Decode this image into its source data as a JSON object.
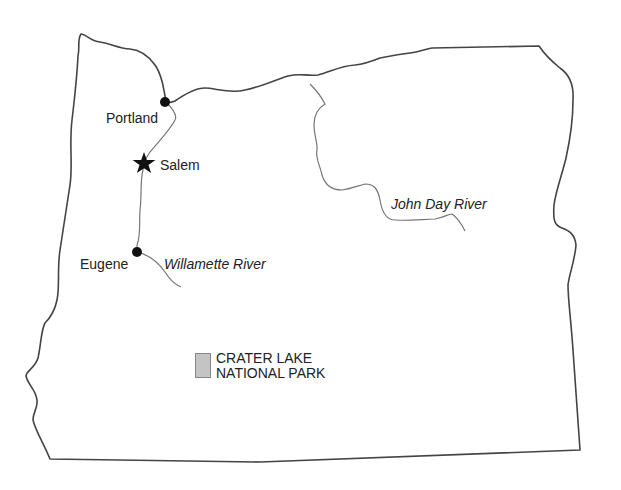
{
  "map": {
    "region": "Oregon",
    "colors": {
      "border": "#444444",
      "river": "#777777",
      "city_marker": "#111111",
      "park_fill": "#c4c4c4"
    },
    "cities": [
      {
        "name": "Portland",
        "marker": "dot",
        "x": 165,
        "y": 102
      },
      {
        "name": "Salem",
        "marker": "star",
        "x": 144,
        "y": 163,
        "capital": true
      },
      {
        "name": "Eugene",
        "marker": "dot",
        "x": 137,
        "y": 252
      }
    ],
    "rivers": [
      {
        "name": "Willamette River"
      },
      {
        "name": "John Day River"
      }
    ],
    "parks": [
      {
        "line1": "CRATER LAKE",
        "line2": "NATIONAL PARK"
      }
    ]
  }
}
